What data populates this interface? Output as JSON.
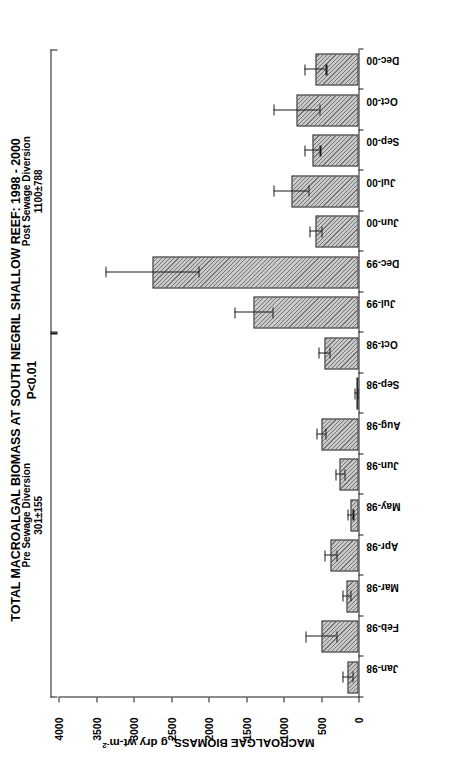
{
  "figure": {
    "title": "TOTAL MACROALGAL BIOMASS AT SOUTH NEGRIL SHALLOW REEF: 1998 - 2000",
    "subtitle": "P<0.01"
  },
  "annotations": {
    "pre": {
      "line1": "Pre Sewage Diversion",
      "line2": "301±155"
    },
    "post": {
      "line1": "Post Sewage Diversion",
      "line2": "1100±788"
    }
  },
  "axis": {
    "y_title_main": "MACROALGAE BIOMASS, g dry wt-m",
    "y_title_sup": "-2",
    "y_ticks": [
      "0",
      "500",
      "1000",
      "1500",
      "2000",
      "2500",
      "3000",
      "3500",
      "4000"
    ]
  },
  "chart_data": {
    "type": "bar",
    "title": "TOTAL MACROALGAL BIOMASS AT SOUTH NEGRIL SHALLOW REEF: 1998 - 2000",
    "subtitle": "P<0.01",
    "xlabel": "",
    "ylabel": "MACROALGAE BIOMASS, g dry wt-m-2",
    "ylim": [
      0,
      4000
    ],
    "ytick_values": [
      0,
      500,
      1000,
      1500,
      2000,
      2500,
      3000,
      3500,
      4000
    ],
    "grid": false,
    "legend": "none",
    "orientation": "vertical-bars-rotated-90",
    "categories": [
      "Jan-98",
      "Feb-98",
      "Mar-98",
      "Apr-98",
      "May-98",
      "Jun-98",
      "Aug-98",
      "Sep-98",
      "Oct-98",
      "Jul-99",
      "Dec-99",
      "Jun-00",
      "Jul-00",
      "Sep-00",
      "Oct-00",
      "Dec-00"
    ],
    "values": [
      150,
      500,
      160,
      380,
      110,
      250,
      500,
      30,
      460,
      1400,
      2750,
      580,
      900,
      620,
      830,
      580
    ],
    "errors": [
      70,
      210,
      55,
      80,
      35,
      60,
      60,
      20,
      75,
      250,
      620,
      80,
      230,
      105,
      310,
      145
    ],
    "groups": [
      {
        "name": "Pre Sewage Diversion",
        "mean": 301,
        "sd": 155,
        "categories": [
          "Jan-98",
          "Feb-98",
          "Mar-98",
          "Apr-98",
          "May-98",
          "Jun-98",
          "Aug-98",
          "Sep-98",
          "Oct-98"
        ]
      },
      {
        "name": "Post Sewage Diversion",
        "mean": 1100,
        "sd": 788,
        "categories": [
          "Jul-99",
          "Dec-99",
          "Jun-00",
          "Jul-00",
          "Sep-00",
          "Oct-00",
          "Dec-00"
        ]
      }
    ],
    "significance": "P<0.01"
  },
  "style": {
    "bar_fill": "#c9c9c9",
    "bar_edge": "#2b2b2b",
    "axis_color": "#1a1a1a",
    "background": "#ffffff"
  }
}
